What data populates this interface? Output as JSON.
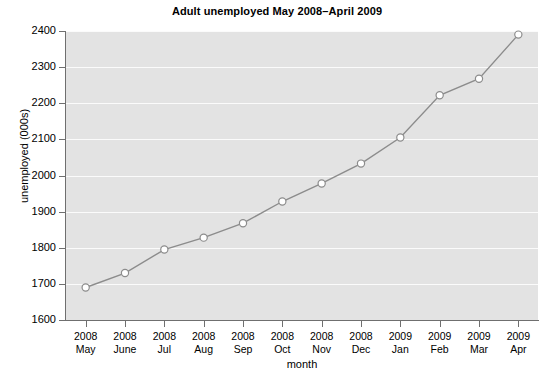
{
  "chart_data": {
    "type": "line",
    "title": "Adult unemployed May 2008–April 2009",
    "xlabel": "month",
    "ylabel": "unemployed (000s)",
    "categories": [
      "2008 May",
      "2008 June",
      "2008 Jul",
      "2008 Aug",
      "2008 Sep",
      "2008 Oct",
      "2008 Nov",
      "2008 Dec",
      "2009 Jan",
      "2009 Feb",
      "2009 Mar",
      "2009 Apr"
    ],
    "category_lines": [
      {
        "year": "2008",
        "month": "May"
      },
      {
        "year": "2008",
        "month": "June"
      },
      {
        "year": "2008",
        "month": "Jul"
      },
      {
        "year": "2008",
        "month": "Aug"
      },
      {
        "year": "2008",
        "month": "Sep"
      },
      {
        "year": "2008",
        "month": "Oct"
      },
      {
        "year": "2008",
        "month": "Nov"
      },
      {
        "year": "2008",
        "month": "Dec"
      },
      {
        "year": "2009",
        "month": "Jan"
      },
      {
        "year": "2009",
        "month": "Feb"
      },
      {
        "year": "2009",
        "month": "Mar"
      },
      {
        "year": "2009",
        "month": "Apr"
      }
    ],
    "values": [
      1690,
      1730,
      1795,
      1828,
      1868,
      1928,
      1978,
      2033,
      2105,
      2222,
      2268,
      2390
    ],
    "series": [
      {
        "name": "unemployed (000s)",
        "values": [
          1690,
          1730,
          1795,
          1828,
          1868,
          1928,
          1978,
          2033,
          2105,
          2222,
          2268,
          2390
        ]
      }
    ],
    "ylim": [
      1600,
      2400
    ],
    "yticks": [
      1600,
      1700,
      1800,
      1900,
      2000,
      2100,
      2200,
      2300,
      2400
    ],
    "ytick_labels": [
      "1600",
      "1700",
      "1800",
      "1900",
      "2000",
      "2100",
      "2200",
      "2300",
      "2400"
    ],
    "grid": true,
    "grid_color": "#fbfbfb",
    "plot_background": "#e3e3e3",
    "line_color": "#8c8c8c",
    "marker": "open-circle",
    "marker_face_color": "#ffffff",
    "marker_edge_color": "#8c8c8c",
    "legend": null,
    "legend_position": "none"
  }
}
